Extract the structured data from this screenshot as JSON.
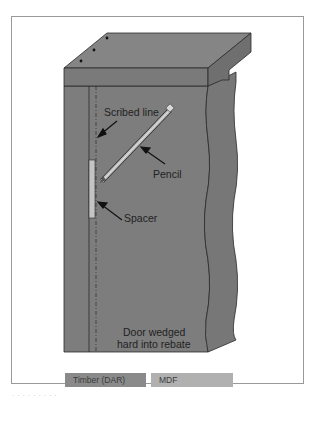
{
  "diagram": {
    "colors": {
      "timber": "#7d7d7d",
      "timber_dark": "#6f6f6f",
      "mdf": "#a9a9a9",
      "outline": "#2a2a2a",
      "spacer": "#c4c4c4",
      "frame_border": "#9a9a9a"
    },
    "labels": {
      "scribed_line": "Scribed line",
      "pencil": "Pencil",
      "spacer": "Spacer",
      "door_line1": "Door wedged",
      "door_line2": "hard into rebate"
    },
    "legend": [
      {
        "label": "Timber (DAR)",
        "color": "#8a8a8a"
      },
      {
        "label": "MDF",
        "color": "#b0b0b0"
      }
    ],
    "caption": "· · · · · · · · ·"
  }
}
